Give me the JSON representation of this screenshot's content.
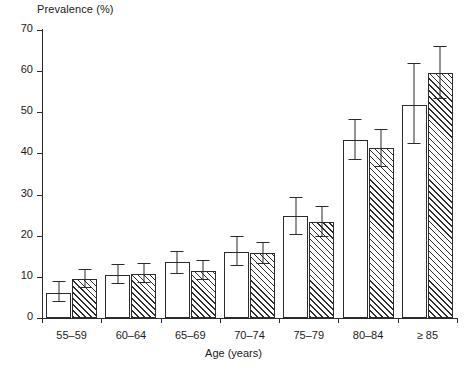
{
  "chart_data": {
    "type": "bar",
    "title": "",
    "ylabel": "Prevalence (%)",
    "xlabel": "Age (years)",
    "ylim": [
      0,
      70
    ],
    "yticks": [
      0,
      10,
      20,
      30,
      40,
      50,
      60,
      70
    ],
    "grid": false,
    "legend": "none",
    "categories": [
      "55–59",
      "60–64",
      "65–69",
      "70–74",
      "75–79",
      "80–84",
      "≥ 85"
    ],
    "series": [
      {
        "name": "open",
        "fill": "white",
        "values": [
          6.0,
          10.5,
          13.5,
          16.0,
          24.8,
          43.2,
          51.7
        ],
        "err_low": [
          3.8,
          8.3,
          10.8,
          12.6,
          20.2,
          38.3,
          42.2
        ],
        "err_high": [
          9.0,
          13.2,
          16.4,
          20.0,
          29.5,
          48.3,
          62.0
        ]
      },
      {
        "name": "hatched",
        "fill": "diagonal-hatch",
        "values": [
          9.4,
          10.8,
          11.4,
          15.7,
          23.3,
          41.3,
          59.6
        ],
        "err_low": [
          7.3,
          8.5,
          9.2,
          13.2,
          19.6,
          36.6,
          53.2
        ],
        "err_high": [
          12.0,
          13.4,
          14.2,
          18.5,
          27.3,
          46.0,
          66.2
        ]
      }
    ]
  },
  "axis": {
    "y_tick_labels": [
      "0",
      "10",
      "20",
      "30",
      "40",
      "50",
      "60",
      "70"
    ]
  }
}
